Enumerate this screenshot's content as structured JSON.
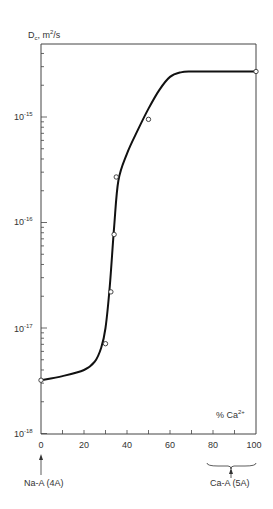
{
  "chart_data": {
    "type": "line",
    "title": "",
    "ylabel": "D_c, m^2/s",
    "xlabel": "% Ca2+",
    "yscale": "log",
    "ylim": [
      1e-18,
      5e-15
    ],
    "xlim": [
      0,
      100
    ],
    "x_ticks": [
      0,
      20,
      40,
      60,
      80,
      100
    ],
    "y_tick_labels": [
      "10^-15",
      "10^-16",
      "10^-17",
      "10^-18"
    ],
    "grid": false,
    "legend": null,
    "series": [
      {
        "name": "fitted curve",
        "style": "line",
        "x": [
          0,
          10,
          20,
          25,
          28,
          30,
          32,
          34,
          36,
          40,
          45,
          50,
          55,
          60,
          65,
          70,
          80,
          90,
          100
        ],
        "y": [
          3.2e-18,
          3.5e-18,
          4e-18,
          4.8e-18,
          6.5e-18,
          1e-17,
          2.5e-17,
          9e-17,
          2.5e-16,
          4.5e-16,
          7.5e-16,
          1.2e-15,
          1.8e-15,
          2.4e-15,
          2.65e-15,
          2.7e-15,
          2.7e-15,
          2.7e-15,
          2.7e-15
        ]
      },
      {
        "name": "measured",
        "style": "open-circle",
        "x": [
          0,
          30,
          32.5,
          34,
          35,
          50,
          100
        ],
        "y": [
          3.2e-18,
          7.1e-18,
          2.2e-17,
          7.7e-17,
          2.7e-16,
          9.5e-16,
          2.7e-15
        ]
      }
    ],
    "annotations": [
      {
        "text": "Na-A (4A)",
        "at_x": 0,
        "marker": "arrow"
      },
      {
        "text": "Ca-A (5A)",
        "at_x": [
          80,
          100
        ],
        "marker": "brace-arrow"
      }
    ]
  },
  "labels": {
    "ylabel_main": "D",
    "ylabel_sub": "c",
    "ylabel_rest": ", m",
    "ylabel_sup": "2",
    "ylabel_unit": "/s",
    "xlabel_main": "% Ca",
    "xlabel_sup": "2+",
    "na_label": "Na-A (4A)",
    "ca_label": "Ca-A (5A)",
    "ytick_base": "10",
    "yticks": [
      "-15",
      "-16",
      "-17",
      "-18"
    ],
    "xticks": [
      "0",
      "20",
      "40",
      "60",
      "80",
      "100"
    ]
  }
}
